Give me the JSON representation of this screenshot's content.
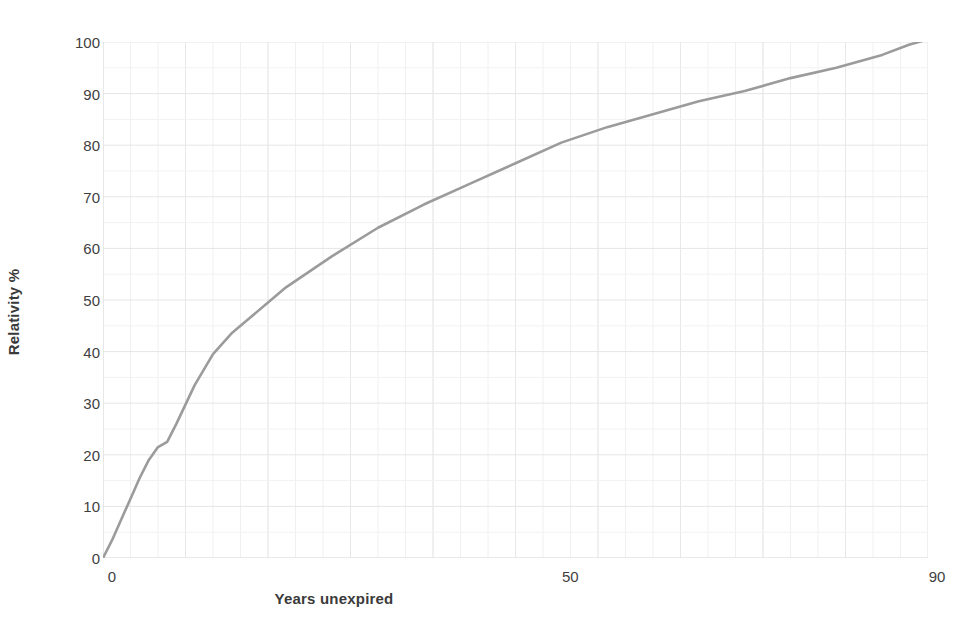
{
  "chart_data": {
    "type": "line",
    "title": "",
    "xlabel": "Years unexpired",
    "ylabel": "Relativity %",
    "xlim": [
      0,
      90
    ],
    "ylim": [
      0,
      100
    ],
    "xticks": [
      "0",
      "50",
      "90"
    ],
    "xtick_values": [
      0,
      50,
      90
    ],
    "yticks": [
      "0",
      "10",
      "20",
      "30",
      "40",
      "50",
      "60",
      "70",
      "80",
      "90",
      "100"
    ],
    "ytick_values": [
      0,
      10,
      20,
      30,
      40,
      50,
      60,
      70,
      80,
      90,
      100
    ],
    "grid": true,
    "legend": "none",
    "line_color": "#9b9b9b",
    "series": [
      {
        "name": "Relativity",
        "x": [
          0,
          1,
          2,
          3,
          4,
          5,
          6,
          7,
          8,
          10,
          12,
          14,
          16,
          18,
          20,
          25,
          30,
          35,
          40,
          45,
          50,
          55,
          60,
          65,
          70,
          75,
          80,
          85,
          88,
          90
        ],
        "values": [
          0,
          3.5,
          7.5,
          11.5,
          15.5,
          19,
          21.5,
          22.5,
          26,
          33.5,
          39.5,
          43.5,
          46.5,
          49.5,
          52.5,
          58.5,
          64,
          68.5,
          72.5,
          76.5,
          80.5,
          83.5,
          86,
          88.5,
          90.5,
          93,
          95,
          97.5,
          99.5,
          100.5
        ]
      }
    ]
  },
  "axes": {
    "y_title": "Relativity %",
    "x_title": "Years unexpired"
  }
}
